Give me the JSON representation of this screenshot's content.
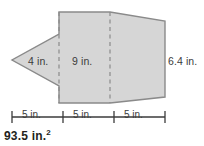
{
  "figure": {
    "type": "composite-polygon-area-diagram",
    "fill_color": "#d6d6d6",
    "stroke_color": "#8a8a8a",
    "dashed_color": "#8a8a8a",
    "labels": {
      "left_height": "4 in.",
      "middle_height": "9 in.",
      "right_height": "6.4 in."
    }
  },
  "ruler": {
    "segments": [
      {
        "label": "5 in."
      },
      {
        "label": "5 in."
      },
      {
        "label": "5 in."
      }
    ]
  },
  "answer": {
    "value": "93.5 in.",
    "exponent": "2"
  }
}
